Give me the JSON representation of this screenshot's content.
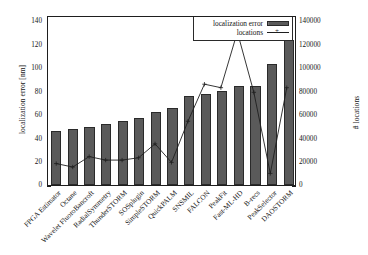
{
  "chart_data": {
    "type": "bar",
    "title": "",
    "subtitle": "",
    "xlabel": "",
    "ylabel": "localization error [nm]",
    "y2label": "# locations",
    "ylim": [
      0,
      145
    ],
    "y2lim": [
      0,
      145000
    ],
    "yticks": [
      0,
      20,
      40,
      60,
      80,
      100,
      120,
      140
    ],
    "y2ticks": [
      0,
      20000,
      40000,
      60000,
      80000,
      100000,
      120000,
      140000
    ],
    "ytick_labels": [
      "0",
      "20",
      "40",
      "60",
      "80",
      "100",
      "120",
      "140"
    ],
    "y2tick_labels": [
      "0",
      "20000",
      "40000",
      "60000",
      "80000",
      "100000",
      "120000",
      "140000"
    ],
    "grid": false,
    "legend_position": "top-right",
    "categories": [
      "FPGA Estimator",
      "Octane",
      "Wavelet FluoroBancroft",
      "RadialSymmetry",
      "ThunderSTORM",
      "SOSplugin",
      "SimpleSTORM",
      "QuickPALM",
      "SNSMIL",
      "FALCON",
      "PeakFit",
      "Fast-ML-HD",
      "B-recs",
      "PeakSelector",
      "DAOSTORM"
    ],
    "series": [
      {
        "name": "localization error",
        "type": "bar",
        "axis": "left",
        "unit": "nm",
        "color": "#5a5a5a",
        "values": [
          46,
          47.5,
          49.5,
          52,
          54.5,
          57,
          62,
          65.5,
          76,
          78,
          80.5,
          84.5,
          84.5,
          103.5,
          124
        ]
      },
      {
        "name": "locations",
        "type": "line",
        "axis": "right",
        "unit": "count",
        "color": "#1e1e1e",
        "marker": "+",
        "values": [
          18500,
          15500,
          24500,
          21500,
          21500,
          23500,
          35500,
          19500,
          55000,
          87000,
          84000,
          132000,
          80000,
          10000,
          84000
        ]
      }
    ]
  },
  "axes": {
    "left_title": "localization error [nm]",
    "right_title": "# locations"
  },
  "legend": {
    "items": [
      {
        "label": "localization error",
        "swatch": "bar-swatch"
      },
      {
        "label": "locations",
        "swatch": "line-plus-swatch"
      }
    ]
  }
}
